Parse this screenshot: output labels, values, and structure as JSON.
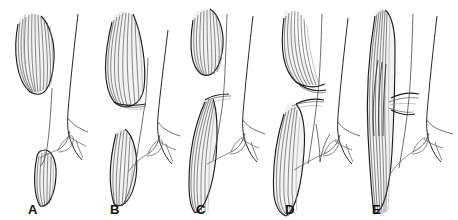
{
  "figure": {
    "background_color": "#ffffff",
    "ink_color": "#1b1b1b",
    "fiber_color": "#4a4a4a",
    "width": 458,
    "height": 220,
    "style": "anatomical line drawing",
    "panel_count": 5
  },
  "panels": [
    {
      "id": "panel-a",
      "label": "A",
      "label_x": 28,
      "x": 0,
      "muscle_bellies": 2,
      "description": "Two separate fusiform muscle bellies, upper belly free and unattached, lower belly small and tapering, with nerve trunk and branching vessel to the right",
      "nerve_branches": 2
    },
    {
      "id": "panel-b",
      "label": "B",
      "label_x": 110,
      "x": 92,
      "muscle_bellies": 2,
      "description": "Two muscle bellies, upper belly elongated and curving with fibers converging to a tendinous end, lower belly slender and tapering",
      "nerve_branches": 2
    },
    {
      "id": "panel-c",
      "label": "C",
      "label_x": 196,
      "x": 183,
      "muscle_bellies": 2,
      "description": "Upper belly short and free, lower belly long descending band crossing behind the neurovascular bundle",
      "nerve_branches": 2
    },
    {
      "id": "panel-d",
      "label": "D",
      "label_x": 285,
      "x": 272,
      "muscle_bellies": 2,
      "description": "Upper and lower bellies nearly meeting, fibers curving to a common short intermediate tendon",
      "nerve_branches": 2
    },
    {
      "id": "panel-e",
      "label": "E",
      "label_x": 372,
      "x": 361,
      "muscle_bellies": 1,
      "description": "Single continuous fused muscle band spanning the full length with a narrowed mid-portion",
      "nerve_branches": 2
    }
  ]
}
